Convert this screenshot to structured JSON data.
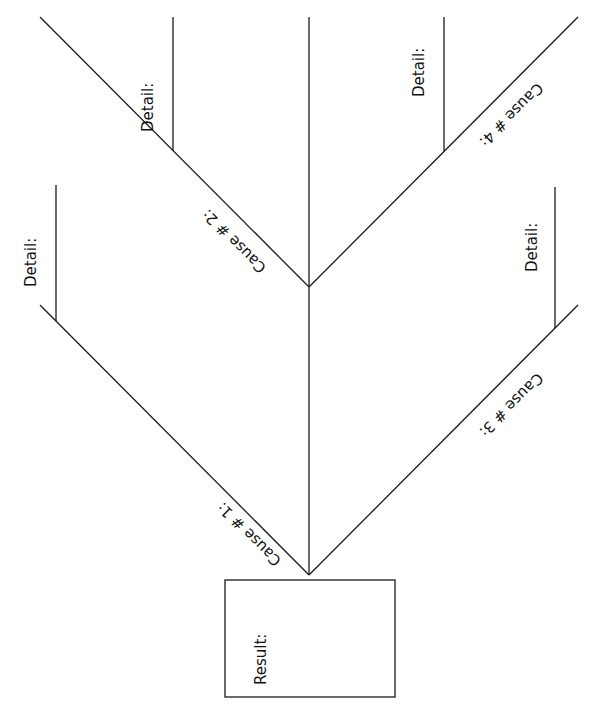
{
  "diagram": {
    "type": "fishbone",
    "orientation": "vertical",
    "result": {
      "label": "Result:"
    },
    "causes": [
      {
        "id": 1,
        "label": "Cause # 1:",
        "detail_label": "Detail:"
      },
      {
        "id": 2,
        "label": "Cause # 2:",
        "detail_label": "Detail:"
      },
      {
        "id": 3,
        "label": "Cause # 3:",
        "detail_label": "Detail:"
      },
      {
        "id": 4,
        "label": "Cause # 4:",
        "detail_label": "Detail:"
      }
    ],
    "colors": {
      "line": "#1a1a1a",
      "background": "#ffffff",
      "text": "#111111"
    }
  }
}
